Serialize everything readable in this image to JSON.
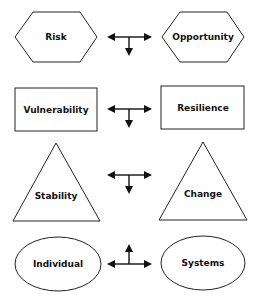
{
  "rows": [
    {
      "left": "Risk",
      "right": "Opportunity",
      "shape": "hexagon",
      "arrow_stem": "down"
    },
    {
      "left": "Vulnerability",
      "right": "Resilience",
      "shape": "rectangle",
      "arrow_stem": "down"
    },
    {
      "left": "Stability",
      "right": "Change",
      "shape": "triangle",
      "arrow_stem": "down"
    },
    {
      "left": "Individual",
      "right": "Systems",
      "shape": "ellipse",
      "arrow_stem": "up"
    }
  ]
}
